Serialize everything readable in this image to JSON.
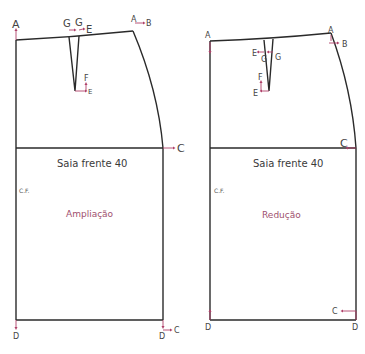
{
  "colors": {
    "outline": "#2a2a2a",
    "arrow": "#b0416a",
    "subtitle": "#a0506e",
    "text": "#3a3a3a"
  },
  "left_pattern": {
    "title": "Saia frente 40",
    "subtitle": "Ampliação",
    "center_front": "C.F.",
    "points": {
      "A_left": "A",
      "A_right": "A",
      "B": "B",
      "G1": "G",
      "G2": "G",
      "E_top": "E",
      "F": "F",
      "E_apex": "E",
      "C_hip": "C",
      "D_left": "D",
      "D_right": "D",
      "C_bottom": "C"
    }
  },
  "right_pattern": {
    "title": "Saia frente 40",
    "subtitle": "Redução",
    "center_front": "C.F.",
    "points": {
      "A_left": "A",
      "A_right": "A",
      "B": "B",
      "E_top": "E",
      "G1": "G",
      "G2": "G",
      "F": "F",
      "E_apex": "E",
      "C_hip": "C",
      "D_left": "D",
      "D_right": "D",
      "C_bottom": "C"
    }
  }
}
